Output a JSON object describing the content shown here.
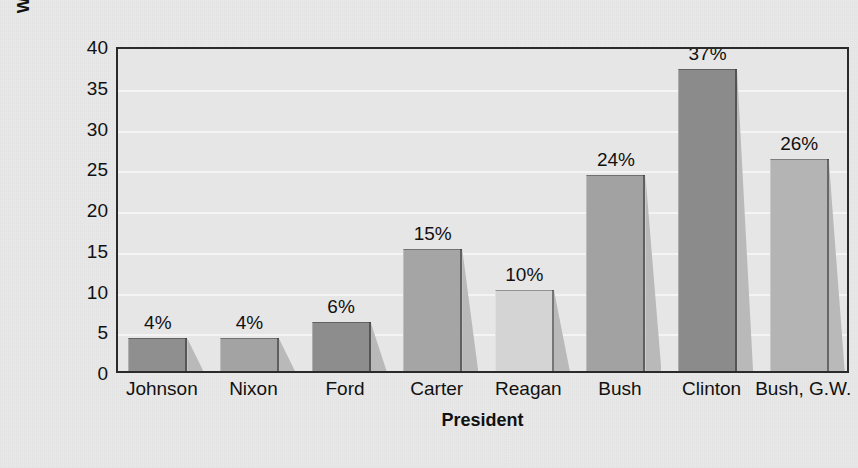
{
  "chart_data": {
    "type": "bar",
    "title": "",
    "subtitle": "",
    "xlabel": "President",
    "ylabel_line1": "Women Appointees",
    "ylabel_line2": "(percentage)",
    "categories": [
      "Johnson",
      "Nixon",
      "Ford",
      "Carter",
      "Reagan",
      "Bush",
      "Clinton",
      "Bush, G.W."
    ],
    "values": [
      4,
      4,
      6,
      15,
      10,
      24,
      37,
      26
    ],
    "data_labels": [
      "4%",
      "4%",
      "6%",
      "15%",
      "10%",
      "24%",
      "37%",
      "26%"
    ],
    "ylim": [
      0,
      40
    ],
    "ytick_values": [
      0,
      5,
      10,
      15,
      20,
      25,
      30,
      35,
      40
    ],
    "ytick_labels": [
      "0",
      "5",
      "10",
      "15",
      "20",
      "25",
      "30",
      "35",
      "40"
    ],
    "grid": true,
    "grid_orientation": "horizontal",
    "legend": "none",
    "bar_colors": [
      "#8f8f8f",
      "#a3a3a3",
      "#8d8d8d",
      "#a5a5a5",
      "#d4d4d4",
      "#a2a2a2",
      "#8b8b8b",
      "#b4b4b4"
    ],
    "colors": {
      "background": "#e9e9e9",
      "plot_background": "#e6e6e6",
      "gridline": "#f4f4f4",
      "frame": "#2a2a2a",
      "text": "#111111",
      "bar_shadow": "#b9b9b9"
    }
  }
}
